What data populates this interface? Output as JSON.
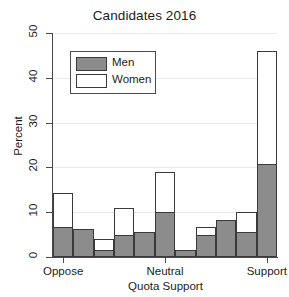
{
  "chart_data": {
    "type": "bar",
    "title": "Candidates 2016",
    "xlabel": "Quota Support",
    "ylabel": "Percent",
    "ylim": [
      0,
      50
    ],
    "yticks": [
      0,
      10,
      20,
      30,
      40,
      50
    ],
    "ytick_labels": [
      "0",
      "10",
      "20",
      "30",
      "40",
      "50"
    ],
    "xtick_labels": [
      "Oppose",
      "Neutral",
      "Support"
    ],
    "xtick_positions": [
      1,
      6,
      11
    ],
    "grid": true,
    "legend_position": "upper left",
    "bins": [
      1,
      2,
      3,
      4,
      5,
      6,
      7,
      8,
      9,
      10,
      11
    ],
    "series": [
      {
        "name": "Men",
        "color": "#8c8c8c",
        "values": [
          6.7,
          6.3,
          1.6,
          5.0,
          5.5,
          10.1,
          1.5,
          4.9,
          8.2,
          5.6,
          20.7
        ]
      },
      {
        "name": "Women",
        "color": "#ffffff",
        "values": [
          14.2,
          6.3,
          4.0,
          11.0,
          5.5,
          19.0,
          1.5,
          6.8,
          8.2,
          10.1,
          46.0
        ]
      }
    ]
  },
  "legend": {
    "items": [
      {
        "label": "Men",
        "swatch": "gray"
      },
      {
        "label": "Women",
        "swatch": "white"
      }
    ]
  }
}
